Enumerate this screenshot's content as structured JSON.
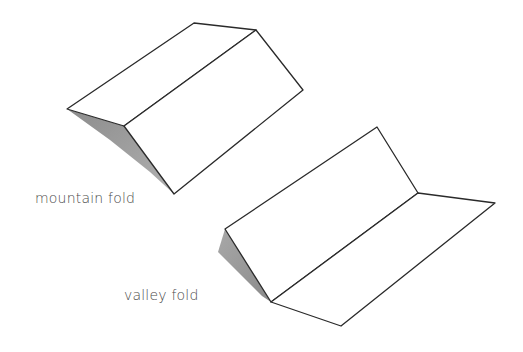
{
  "diagram": {
    "labels": {
      "mountain": "mountain fold",
      "valley": "valley fold"
    },
    "colors": {
      "line": "#2a2a2a",
      "shadow": "#9a9a9a",
      "paper": "#ffffff",
      "text": "#4a4a4a"
    }
  }
}
